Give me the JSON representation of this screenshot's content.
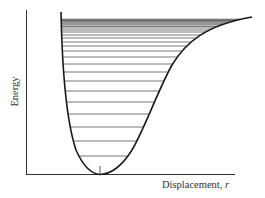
{
  "diagram": {
    "y_axis_label": "Energy",
    "x_axis_label": "Displacement,",
    "x_axis_variable": "r",
    "colors": {
      "curve": "#1a1a1a",
      "levels": "#555555",
      "axes": "#333333",
      "background": "#ffffff"
    },
    "energy_level_y_px": [
      156,
      141,
      127,
      114,
      102,
      91,
      81,
      72,
      64,
      57,
      51,
      46,
      42,
      38,
      35,
      32,
      30,
      28,
      26.5,
      25,
      24,
      23,
      22,
      21.2,
      20.5,
      19.8,
      19.2
    ]
  },
  "chart_data": {
    "type": "line",
    "title": "",
    "xlabel": "Displacement, r",
    "ylabel": "Energy",
    "series": [
      {
        "name": "Potential energy curve (Morse)",
        "description": "asymmetric well: steep repulsive wall at small r, minimum near r_e, asymptote to dissociation energy at large r"
      },
      {
        "name": "Vibrational energy levels",
        "description": "horizontal lines spanning the well; spacing decreases with increasing energy, converging toward dissociation limit",
        "count_approx": 27
      }
    ],
    "grid": false,
    "legend": "none"
  }
}
